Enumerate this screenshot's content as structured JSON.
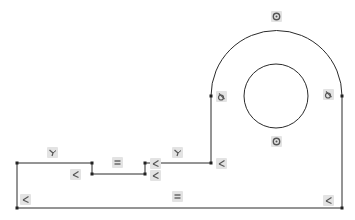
{
  "sketch": {
    "line_color": "#2a2a2a",
    "point_color": "#222222",
    "icon_bg": "#e3e3e3",
    "icon_fg": "#555555",
    "profile": {
      "points": [
        [
          17,
          208
        ],
        [
          17,
          163
        ],
        [
          92,
          163
        ],
        [
          92,
          174
        ],
        [
          145,
          174
        ],
        [
          145,
          163
        ],
        [
          211,
          163
        ],
        [
          211,
          96
        ]
      ],
      "closing_points": [
        [
          342,
          96
        ],
        [
          342,
          208
        ],
        [
          17,
          208
        ]
      ]
    },
    "outer_arc": {
      "cx": 276.5,
      "cy": 96,
      "r": 65.5
    },
    "inner_circle": {
      "cx": 276,
      "cy": 96,
      "r": 32
    },
    "vertices": [
      [
        17,
        163
      ],
      [
        92,
        163
      ],
      [
        92,
        174
      ],
      [
        145,
        174
      ],
      [
        145,
        163
      ],
      [
        211,
        163
      ],
      [
        211,
        96
      ],
      [
        342,
        96
      ],
      [
        342,
        208
      ],
      [
        17,
        208
      ]
    ],
    "relations": [
      {
        "type": "concentric",
        "icon": "concentric-icon",
        "x": 271,
        "y": 11
      },
      {
        "type": "concentric",
        "icon": "concentric-icon",
        "x": 271,
        "y": 136
      },
      {
        "type": "tangent",
        "icon": "tangent-icon",
        "x": 216,
        "y": 91
      },
      {
        "type": "tangent",
        "icon": "tangent-icon",
        "x": 323,
        "y": 89
      },
      {
        "type": "horizontal",
        "icon": "horizontal-icon",
        "x": 47,
        "y": 147
      },
      {
        "type": "vertical",
        "icon": "vertical-icon",
        "x": 70,
        "y": 169
      },
      {
        "type": "vertical",
        "icon": "vertical-icon",
        "x": 20,
        "y": 194
      },
      {
        "type": "equal",
        "icon": "equal-icon",
        "x": 112,
        "y": 157
      },
      {
        "type": "vertical",
        "icon": "vertical-icon",
        "x": 150,
        "y": 158
      },
      {
        "type": "vertical",
        "icon": "vertical-icon",
        "x": 150,
        "y": 170
      },
      {
        "type": "horizontal",
        "icon": "horizontal-icon",
        "x": 172,
        "y": 147
      },
      {
        "type": "vertical",
        "icon": "vertical-icon",
        "x": 216,
        "y": 158
      },
      {
        "type": "equal",
        "icon": "equal-icon",
        "x": 172,
        "y": 191
      },
      {
        "type": "vertical",
        "icon": "vertical-icon",
        "x": 323,
        "y": 195
      }
    ]
  }
}
